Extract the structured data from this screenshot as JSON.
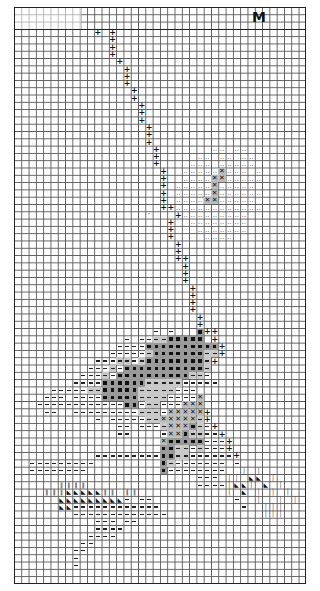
{
  "title_letter": "M",
  "grid": {
    "columns": 40,
    "rows": 79,
    "cell_px": 7.3,
    "header_rows": 3
  },
  "legend": {
    ".": "empty",
    "+": "stem-cross",
    "o": "light-dots",
    "-": "dash",
    "=": "gray-dash",
    "#": "dark-square",
    "X": "cross-box",
    "H": "double-bar",
    "A": "triangle",
    "I": "single-bar",
    "d": "single-dot"
  },
  "pattern": [
    "........................................",
    "........................................",
    "........................................",
    "...........+.+..........................",
    ".............+..........................",
    ".............+..........................",
    ".............+..........................",
    "..............+.........................",
    "...............+........................",
    "...............+........................",
    "...............+........................",
    "................+.......................",
    "................+.......................",
    ".................+......................",
    ".................+......................",
    ".................+......................",
    "..................+.....................",
    "..................+.....................",
    "..................+.....................",
    "...................+.......oo.oo........",
    "...................+.....oo.oo.oo.......",
    "...................+....ooo.ooooo.......",
    "....................+..oooooXooo.o......",
    "....................+..ooooXXooooo......",
    "....................+.oooooXooooo.......",
    "....................+.oooooXoooooo......",
    "....................+.ooooXXooooo.......",
    "....................++oooooooooooo......",
    "..................d...+ooooooooo........",
    ".....................+..oooooooo........",
    ".....................+...ooooooo........",
    ".....................+....oooo..........",
    "......................+.................",
    "......................+.................",
    "......................++................",
    ".......................+................",
    ".......................+................",
    ".......................+................",
    "........................+...............",
    "........................+...............",
    "........................+...............",
    "........................+...............",
    ".........................+..............",
    ".........................+..............",
    "...................-.-...#++............",
    "...............-.--==#####.+............",
    "..............----##########+...........",
    ".............-----=#######==+...........",
    "...........---==-=########=+............",
    "..........---=-###########=.............",
    ".........---=-##########==-.............",
    "........----######=====-----............",
    ".....-----==#####=====---...............",
    "....---.----#####====----X..............",
    "...------------##-==---XXX..............",
    "....--..---------===-XXXXX+.............",
    "...........-.-----==XXXXX=+.............",
    "..............--.---=XXX#=-+............",
    "..............--....-XX#==--+...........",
    "....................X#####---+..........",
    "....................##==-=---+..........",
    "...........---------##==------+.........",
    "..---------.........#=-------.-.........",
    "..--------..........#--------..I.I......",
    ".........................---.II.AA.I....",
    "......HHHH...............----IAAI.A.I...",
    "....HHHAAAAAHH.HH............I.A.I.I.I..",
    "......AAAAAAAAA-.--...........-..I..I.I.",
    "......AA------------...........-..III...",
    "........-------------.............III...",
    "...........---.--.........................",
    "...........----...........................",
    "..........----............................",
    ".........--...............................",
    "........--................................",
    "........-.................................",
    "........-.................................",
    "........................................",
    "........................................"
  ]
}
